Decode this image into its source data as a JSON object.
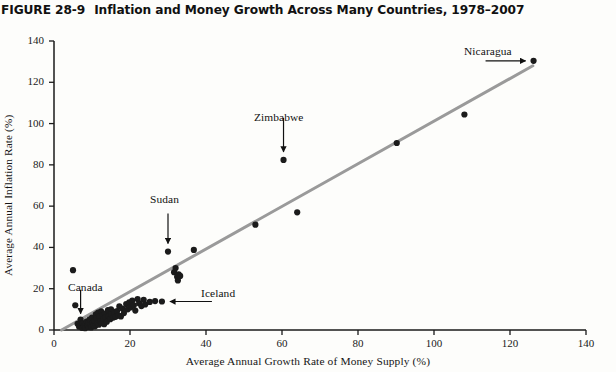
{
  "figure": {
    "number": "FIGURE 28-9",
    "caption": "Inflation and Money Growth Across Many Countries, 1978–2007"
  },
  "chart_data": {
    "type": "scatter",
    "title": "Inflation and Money Growth Across Many Countries, 1978–2007",
    "xlabel": "Average Annual Growth Rate of Money Supply (%)",
    "ylabel": "Average Annual Inflation Rate (%)",
    "xlim": [
      0,
      140
    ],
    "ylim": [
      0,
      140
    ],
    "xticks": [
      0,
      20,
      40,
      60,
      80,
      100,
      120,
      140
    ],
    "yticks": [
      0,
      20,
      40,
      60,
      80,
      100,
      120,
      140
    ],
    "grid": false,
    "legend": null,
    "series": [
      {
        "name": "Countries",
        "marker": "filled-circle",
        "color": "#1b1b1b",
        "points": [
          [
            5.0,
            29.0
          ],
          [
            5.6,
            12.0
          ],
          [
            6.2,
            3.0
          ],
          [
            6.6,
            1.6
          ],
          [
            7.0,
            5.0
          ],
          [
            7.0,
            2.2
          ],
          [
            7.4,
            1.0
          ],
          [
            7.6,
            3.4
          ],
          [
            7.9,
            1.8
          ],
          [
            8.2,
            2.8
          ],
          [
            8.2,
            0.9
          ],
          [
            8.6,
            4.2
          ],
          [
            8.8,
            2.0
          ],
          [
            9.0,
            3.2
          ],
          [
            9.2,
            1.4
          ],
          [
            9.4,
            5.2
          ],
          [
            9.6,
            2.6
          ],
          [
            9.8,
            1.2
          ],
          [
            10.0,
            6.0
          ],
          [
            10.2,
            3.6
          ],
          [
            10.4,
            2.2
          ],
          [
            10.6,
            4.6
          ],
          [
            10.8,
            1.8
          ],
          [
            11.0,
            7.6
          ],
          [
            11.2,
            5.8
          ],
          [
            11.4,
            3.0
          ],
          [
            11.6,
            8.4
          ],
          [
            11.8,
            2.6
          ],
          [
            12.0,
            6.6
          ],
          [
            12.2,
            4.2
          ],
          [
            12.4,
            9.0
          ],
          [
            12.6,
            3.4
          ],
          [
            12.8,
            7.2
          ],
          [
            13.0,
            5.4
          ],
          [
            13.2,
            2.8
          ],
          [
            13.4,
            8.0
          ],
          [
            13.6,
            6.2
          ],
          [
            13.9,
            4.0
          ],
          [
            14.2,
            9.6
          ],
          [
            14.4,
            6.8
          ],
          [
            14.8,
            5.2
          ],
          [
            15.0,
            10.0
          ],
          [
            15.2,
            7.4
          ],
          [
            15.6,
            6.0
          ],
          [
            15.8,
            8.8
          ],
          [
            16.2,
            6.4
          ],
          [
            16.6,
            9.2
          ],
          [
            17.0,
            7.0
          ],
          [
            17.2,
            11.4
          ],
          [
            17.6,
            6.6
          ],
          [
            18.0,
            10.4
          ],
          [
            18.4,
            8.2
          ],
          [
            19.0,
            12.6
          ],
          [
            19.4,
            10.0
          ],
          [
            19.8,
            13.4
          ],
          [
            20.2,
            11.0
          ],
          [
            20.6,
            14.2
          ],
          [
            21.0,
            12.0
          ],
          [
            21.4,
            9.4
          ],
          [
            22.0,
            15.0
          ],
          [
            22.4,
            13.0
          ],
          [
            23.0,
            11.6
          ],
          [
            23.6,
            14.6
          ],
          [
            24.0,
            12.4
          ],
          [
            25.2,
            13.6
          ],
          [
            26.6,
            14.0
          ],
          [
            28.4,
            13.8
          ],
          [
            30.0,
            38.0
          ],
          [
            31.6,
            28.0
          ],
          [
            32.0,
            30.0
          ],
          [
            32.4,
            25.8
          ],
          [
            32.6,
            24.0
          ],
          [
            32.8,
            27.0
          ],
          [
            33.2,
            26.2
          ],
          [
            36.8,
            38.8
          ],
          [
            53.0,
            51.0
          ],
          [
            60.4,
            82.4
          ],
          [
            64.0,
            57.0
          ],
          [
            90.2,
            90.6
          ],
          [
            108.0,
            104.4
          ],
          [
            126.2,
            130.4
          ]
        ]
      }
    ],
    "trend_line": {
      "name": "fitted-trend-line",
      "color": "#9a9a9a",
      "from": [
        2.0,
        0.0
      ],
      "to": [
        126.0,
        128.0
      ]
    },
    "annotations": [
      {
        "label": "Canada",
        "arrow": "down",
        "target_point": [
          7.0,
          4.5
        ]
      },
      {
        "label": "Iceland",
        "arrow": "left",
        "target_point": [
          28.4,
          13.8
        ]
      },
      {
        "label": "Sudan",
        "arrow": "down",
        "target_point": [
          30.0,
          38.0
        ]
      },
      {
        "label": "Zimbabwe",
        "arrow": "down",
        "target_point": [
          60.4,
          82.4
        ]
      },
      {
        "label": "Nicaragua",
        "arrow": "right",
        "target_point": [
          126.2,
          130.4
        ]
      }
    ]
  },
  "axis": {
    "y_tick_labels": [
      "0",
      "20",
      "40",
      "60",
      "80",
      "100",
      "120",
      "140"
    ],
    "x_tick_labels": [
      "0",
      "20",
      "40",
      "60",
      "80",
      "100",
      "120",
      "140"
    ],
    "y_caption": "Average Annual Inflation Rate (%)",
    "x_caption": "Average Annual Growth Rate of Money Supply (%)"
  },
  "annotation_labels": {
    "canada": "Canada",
    "iceland": "Iceland",
    "sudan": "Sudan",
    "zimbabwe": "Zimbabwe",
    "nicaragua": "Nicaragua"
  }
}
